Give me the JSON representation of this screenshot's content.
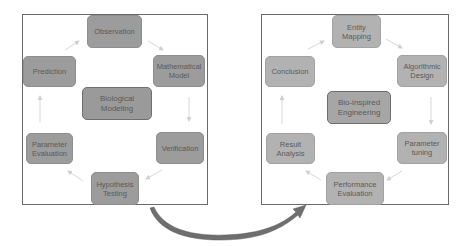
{
  "left_panel": {
    "center": "Biological Modeling",
    "nodes": {
      "top": "Observation",
      "top_right": "Mathematical Model",
      "bottom_right": "Verification",
      "bottom": "Hypothesis Testing",
      "bottom_left": "Parameter Evaluation",
      "top_left": "Prediction"
    }
  },
  "right_panel": {
    "center": "Bio-inspired Engineering",
    "nodes": {
      "top": "Entity Mapping",
      "top_right": "Algorithmic Design",
      "bottom_right": "Parameter tuning",
      "bottom": "Performance Evaluation",
      "bottom_left": "Result Analysis",
      "top_left": "Conclusion"
    }
  },
  "colors": {
    "left_node": "#9c9c9c",
    "right_node": "#b2b2b2",
    "frame_border": "#6a6a6a",
    "cycle_arrow": "#d8d8d8",
    "transfer_arrow": "#6e6e6e"
  }
}
